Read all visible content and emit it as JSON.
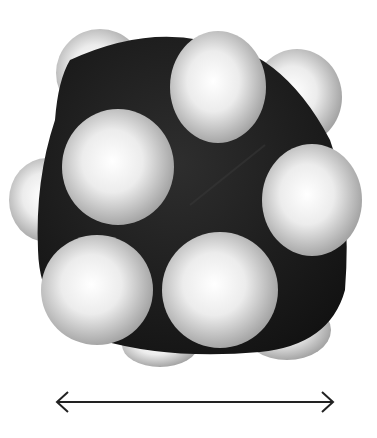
{
  "figure": {
    "type": "space-filling molecular model",
    "colors": {
      "carbon": "#1c1c1c",
      "hydrogen_light": "#ffffff",
      "hydrogen_shadow": "#9a9a9a",
      "arrow": "#222222",
      "background": "#ffffff"
    },
    "atoms": [
      {
        "element": "H",
        "cx": 100,
        "cy": 73,
        "rx": 44,
        "ry": 44,
        "layer": "back"
      },
      {
        "element": "H",
        "cx": 297,
        "cy": 97,
        "rx": 45,
        "ry": 48,
        "layer": "back"
      },
      {
        "element": "H",
        "cx": 47,
        "cy": 200,
        "rx": 38,
        "ry": 42,
        "layer": "back"
      },
      {
        "element": "H",
        "cx": 160,
        "cy": 345,
        "rx": 38,
        "ry": 22,
        "layer": "back"
      },
      {
        "element": "H",
        "cx": 287,
        "cy": 330,
        "rx": 44,
        "ry": 30,
        "layer": "back"
      },
      {
        "element": "H",
        "cx": 218,
        "cy": 87,
        "rx": 48,
        "ry": 56,
        "layer": "front"
      },
      {
        "element": "H",
        "cx": 118,
        "cy": 167,
        "rx": 56,
        "ry": 58,
        "layer": "front"
      },
      {
        "element": "H",
        "cx": 312,
        "cy": 200,
        "rx": 50,
        "ry": 56,
        "layer": "front"
      },
      {
        "element": "H",
        "cx": 97,
        "cy": 290,
        "rx": 56,
        "ry": 55,
        "layer": "front"
      },
      {
        "element": "H",
        "cx": 220,
        "cy": 290,
        "rx": 58,
        "ry": 58,
        "layer": "front"
      }
    ],
    "dimension_arrow": {
      "x1": 56,
      "x2": 333,
      "y": 402,
      "direction": "double-headed"
    }
  },
  "caption": {
    "text": ""
  }
}
